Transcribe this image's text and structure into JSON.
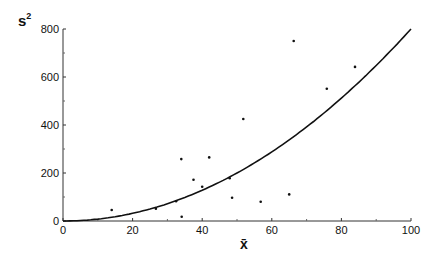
{
  "chart_data": {
    "type": "scatter",
    "title": "",
    "xlabel": "x̄",
    "ylabel": "s²",
    "xlim": [
      0,
      100
    ],
    "ylim": [
      0,
      800
    ],
    "x_ticks": [
      0,
      20,
      40,
      60,
      80,
      100
    ],
    "y_ticks": [
      0,
      200,
      400,
      600,
      800
    ],
    "grid": false,
    "legend": null,
    "series": [
      {
        "name": "observations",
        "type": "scatter",
        "points": [
          {
            "x": 14,
            "y": 46
          },
          {
            "x": 26.7,
            "y": 51
          },
          {
            "x": 32.5,
            "y": 82
          },
          {
            "x": 34,
            "y": 258
          },
          {
            "x": 34.1,
            "y": 18
          },
          {
            "x": 37.5,
            "y": 172
          },
          {
            "x": 40,
            "y": 143
          },
          {
            "x": 42,
            "y": 265
          },
          {
            "x": 47.9,
            "y": 178
          },
          {
            "x": 48.6,
            "y": 97
          },
          {
            "x": 51.8,
            "y": 425
          },
          {
            "x": 56.8,
            "y": 80
          },
          {
            "x": 65,
            "y": 111
          },
          {
            "x": 66.3,
            "y": 750
          },
          {
            "x": 75.8,
            "y": 551
          },
          {
            "x": 83.9,
            "y": 642
          }
        ]
      },
      {
        "name": "fitted curve",
        "type": "line",
        "equation": "s² = 0.08·x̄²",
        "coefficient": 0.08,
        "exponent": 2
      }
    ]
  },
  "labels": {
    "ylabel_base": "s",
    "ylabel_sup": "2",
    "xlabel": "x̄"
  }
}
